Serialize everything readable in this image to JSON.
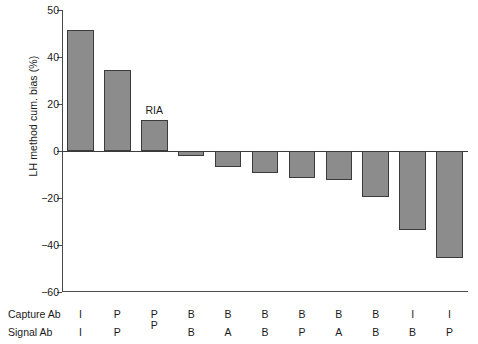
{
  "chart_data": {
    "type": "bar",
    "title": "",
    "xlabel": "",
    "ylabel": "LH method cum. bias (%)",
    "ylim": [
      -60,
      50
    ],
    "yticks": [
      50,
      40,
      20,
      0,
      -20,
      -40,
      -60
    ],
    "ytick_labels": [
      "50",
      "40",
      "20",
      "0",
      "-20",
      "-40",
      "-60"
    ],
    "grid": false,
    "legend": null,
    "annotations": [
      {
        "text": "RIA",
        "bar_index": 2,
        "position": "above-bar"
      }
    ],
    "categories": [
      "I/I",
      "P/P",
      "P",
      "B/B",
      "B/A",
      "B/B",
      "B/P",
      "B/A",
      "B/B",
      "I/B",
      "I/P"
    ],
    "values": [
      51.5,
      34.5,
      13.0,
      -2.0,
      -7.0,
      -9.5,
      -11.5,
      -12.5,
      -19.5,
      -33.5,
      -45.5
    ],
    "series": [
      {
        "name": "LH method cum. bias (%)",
        "values": [
          51.5,
          34.5,
          13.0,
          -2.0,
          -7.0,
          -9.5,
          -11.5,
          -12.5,
          -19.5,
          -33.5,
          -45.5
        ]
      }
    ],
    "bar_color": "#8c8c8c",
    "bar_edge_color": "#3b3b3b"
  },
  "category_table": {
    "rows": [
      {
        "label": "Capture Ab",
        "values": [
          "I",
          "P",
          "P",
          "B",
          "B",
          "B",
          "B",
          "B",
          "B",
          "I",
          "I"
        ]
      },
      {
        "label": "Signal Ab",
        "values": [
          "I",
          "P",
          "",
          "B",
          "A",
          "B",
          "P",
          "A",
          "B",
          "B",
          "P"
        ]
      }
    ],
    "merged_columns": [
      {
        "index": 2,
        "value": "P"
      }
    ]
  }
}
